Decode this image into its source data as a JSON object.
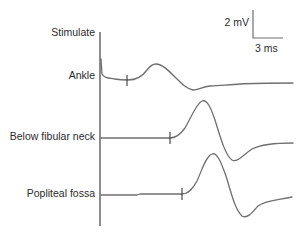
{
  "figure": {
    "scale_bar": {
      "vertical_label": "2 mV",
      "horizontal_label": "3 ms"
    },
    "stimulate_label": "Stimulate",
    "traces": [
      {
        "label": "Ankle"
      },
      {
        "label": "Below fibular neck"
      },
      {
        "label": "Popliteal fossa"
      }
    ],
    "colors": {
      "trace": "#6f6f6f",
      "text": "#2b2b2b",
      "background": "#ffffff"
    }
  }
}
